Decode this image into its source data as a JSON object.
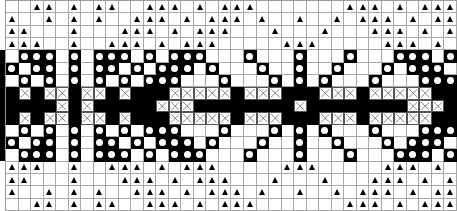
{
  "chart": {
    "columns": 36,
    "rows": 17,
    "legend": {
      "W": "empty-cell",
      "B": "filled-cell",
      "O": "filled-cell-with-dot",
      "X": "crossed-cell",
      "T": "triangle-cell"
    },
    "colors": {
      "ink": "#000000",
      "paper": "#ffffff",
      "grid": "#a8a8a8"
    },
    "grid": [
      "WWTTWTWTTWWTTTWTWTTTWWWWWWWTTTWTWTTT",
      "TWWTWTWTWWTTTWTWTTTWTWWTWWTWTTTWTWTT",
      "TTWWWTWWWTTTWTWTTTWWWTWWWTWWWTTTWTWT",
      "TTTWWTWWTTTWTWTTTWWWWWTTTWWWWWTTTWTW",
      "WOOOWOWOOOWOWOOOWWWOWWWOWWWOWWWOOOWO",
      "OWOOWOWOOWOWOOOWOWWWOWWOWWOWWWOWOOOW",
      "WOWOWOWOWOWOOOWWWOWWWOWOWOWWWOWWWOOO",
      "BXBXXBXXBXBBBXXXXXBXXXBBBXXXBXXXXXBB",
      "BBBBXBXBBBBBXXXBBBBBBBBXBBBBBBBBXXXB",
      "BXBXXBXXBXBBBXXXXXBXXXBBBXXXBXXXXXBB",
      "WOWOWOWOWOWOOOWWWOWWWOWOWOWWWOWWWOOO",
      "OWOOWOWOOWOWOOOWOWWWOWWOWWOWWWOWOOOW",
      "WOOOWOWOOOWOWOOOWWWOWWWOWWWOWWWOOOWO",
      "TTTWWTWWTTTWTWTTTWWWWWTTTWWWWWTTTWTW",
      "TTWWWTWWWTTTWTWTTTWWWTWWWTWWWTTTWTWT",
      "TWWTWTWTWWTTTWTWTTTWTWWTWWTWTTTWTWTT",
      "WWTTWTWTTWWTTTWTWTTTWWWWWWWTTTWTWTTT"
    ],
    "left_bleed": "WWWWBBBBBBBBBWWWW"
  }
}
